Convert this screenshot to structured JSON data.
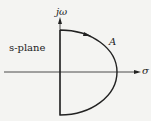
{
  "diagram": {
    "vertical_axis_label": "jω",
    "horizontal_axis_label": "σ",
    "plane_label": "s-plane",
    "contour_label": "A",
    "colors": {
      "line": "#222222",
      "background": "#f4f4f2"
    }
  }
}
